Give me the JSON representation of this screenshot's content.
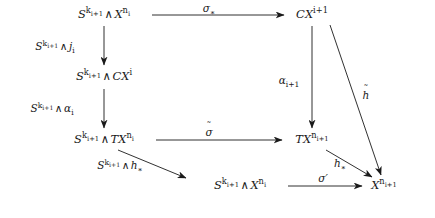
{
  "figure": {
    "kind": "commutative-diagram",
    "background": "#ffffff",
    "ink": "#1a1a1a",
    "width": 435,
    "height": 218
  },
  "nodes": {
    "top_left": {
      "id": "n1",
      "tex": "S^{k_{i+1}} \\wedge X^{n_i}",
      "x": 104,
      "y": 15
    },
    "top_right": {
      "id": "n2",
      "tex": "CX^{i+1}",
      "x": 312,
      "y": 15
    },
    "mid_left_1": {
      "id": "n3",
      "tex": "S^{k_{i+1}} \\wedge CX^{i}",
      "x": 104,
      "y": 77
    },
    "mid_left_2": {
      "id": "n4",
      "tex": "S^{k_{i+1}} \\wedge TX^{n_i}",
      "x": 104,
      "y": 140
    },
    "mid_right": {
      "id": "n5",
      "tex": "TX^{n_{i+1}}",
      "x": 312,
      "y": 140
    },
    "bottom_center": {
      "id": "n6",
      "tex": "S^{k_{i+1}} \\wedge X^{n_i}",
      "x": 240,
      "y": 186
    },
    "bottom_right": {
      "id": "n7",
      "tex": "X^{n_{i+1}}",
      "x": 384,
      "y": 186
    }
  },
  "node_parts": {
    "S": "S",
    "k": "k",
    "i1": "i+1",
    "wedge": "∧",
    "X": "X",
    "n": "n",
    "i": "i",
    "C": "C",
    "T": "T",
    "CX": "CX",
    "TX": "TX"
  },
  "edges": [
    {
      "name": "sigma-star-arrow",
      "from": "top_left",
      "to": "top_right",
      "style": "horizontal",
      "label": "σ∗",
      "label_x": 209,
      "label_y": 7,
      "label_pos": "above"
    },
    {
      "name": "smash-j-arrow",
      "from": "top_left",
      "to": "mid_left_1",
      "style": "vertical",
      "label": "S^{k_{i+1}}\\wedge j_i",
      "label_x": 55,
      "label_y": 46,
      "label_pos": "left"
    },
    {
      "name": "smash-alpha-arrow",
      "from": "mid_left_1",
      "to": "mid_left_2",
      "style": "vertical",
      "label": "S^{k_{i+1}}\\wedge \\alpha_i",
      "label_x": 52,
      "label_y": 108,
      "label_pos": "left"
    },
    {
      "name": "alpha-i1-arrow",
      "from": "top_right",
      "to": "mid_right",
      "style": "vertical",
      "label": "α_{i+1}",
      "label_x": 290,
      "label_y": 80,
      "label_pos": "left"
    },
    {
      "name": "sigma-tilde-arrow",
      "from": "mid_left_2",
      "to": "mid_right",
      "style": "horizontal",
      "label": "σ̃",
      "label_x": 209,
      "label_y": 131,
      "label_pos": "above"
    },
    {
      "name": "h-tilde-arrow",
      "from": "top_right",
      "to": "bottom_right",
      "style": "diagonal",
      "label": "h̃",
      "label_x": 365,
      "label_y": 95,
      "label_pos": "right"
    },
    {
      "name": "smash-h-star-arrow",
      "from": "mid_left_2",
      "to": "bottom_center",
      "style": "diagonal",
      "label": "S^{k_{i+1}}\\wedge h_*",
      "label_x": 118,
      "label_y": 163,
      "label_pos": "below"
    },
    {
      "name": "h-star-arrow",
      "from": "mid_right",
      "to": "bottom_right",
      "style": "diagonal",
      "label": "h_*",
      "label_x": 340,
      "label_y": 163,
      "label_pos": "left"
    },
    {
      "name": "sigma-prime-arrow",
      "from": "bottom_center",
      "to": "bottom_right",
      "style": "horizontal",
      "label": "σ′",
      "label_x": 312,
      "label_y": 178,
      "label_pos": "above"
    }
  ],
  "labels": {
    "sigma_star": "σ",
    "sigma_star_sub": "∗",
    "sigma_tilde": "σ",
    "sigma_prime": "σ",
    "sigma_prime_mark": "′",
    "alpha": "α",
    "alpha_sub_i1": "i+1",
    "alpha_sub_i": "i",
    "j": "j",
    "j_sub": "i",
    "h": "h",
    "h_sub_star": "∗",
    "tilde_glyph": "˜"
  }
}
